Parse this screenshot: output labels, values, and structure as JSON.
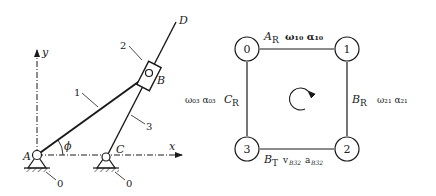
{
  "mechanism": {
    "axes": {
      "x": "x",
      "y": "y"
    },
    "joints": {
      "A": "A",
      "B": "B",
      "C": "C",
      "D": "D"
    },
    "links": {
      "l1": "1",
      "l2": "2",
      "l3": "3"
    },
    "ground_labels": [
      "0",
      "0"
    ],
    "angle": "ϕ"
  },
  "contour_graph": {
    "nodes": [
      "0",
      "1",
      "2",
      "3"
    ],
    "edges": {
      "top": {
        "joint": "A",
        "sub": "R",
        "quantities": "ω₁₀ α₁₀"
      },
      "right": {
        "joint": "B",
        "sub": "R",
        "quantities": "ω₂₁  α₂₁"
      },
      "bottom": {
        "joint": "B",
        "sub": "T",
        "quantities": "v",
        "q1_sub": "B32",
        "q2": "a",
        "q2_sub": "B32"
      },
      "left": {
        "joint": "C",
        "sub": "R",
        "quantities": "ω₀₃ α₀₃"
      }
    }
  },
  "colors": {
    "line": "#1a1a1a",
    "faint": "#555555"
  }
}
